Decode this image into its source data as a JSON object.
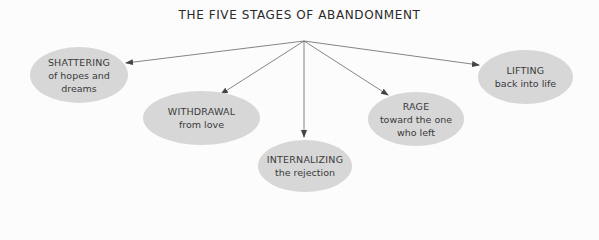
{
  "title": "THE FIVE STAGES OF ABANDONMENT",
  "colors": {
    "background": "#fcfcfc",
    "node_fill": "#d7d7d7",
    "text": "#333333",
    "arrow": "#555555"
  },
  "origin": {
    "x": 304,
    "y": 41
  },
  "stages": [
    {
      "heading": "SHATTERING",
      "sub1": "of hopes and",
      "sub2": "dreams",
      "arrow_tip": {
        "x": 126,
        "y": 63
      }
    },
    {
      "heading": "WITHDRAWAL",
      "sub1": "from love",
      "sub2": "",
      "arrow_tip": {
        "x": 221,
        "y": 94
      }
    },
    {
      "heading": "INTERNALIZING",
      "sub1": "the rejection",
      "sub2": "",
      "arrow_tip": {
        "x": 304,
        "y": 137
      }
    },
    {
      "heading": "RAGE",
      "sub1": "toward the one",
      "sub2": "who left",
      "arrow_tip": {
        "x": 388,
        "y": 95
      }
    },
    {
      "heading": "LIFTING",
      "sub1": "back into life",
      "sub2": "",
      "arrow_tip": {
        "x": 479,
        "y": 65
      }
    }
  ]
}
